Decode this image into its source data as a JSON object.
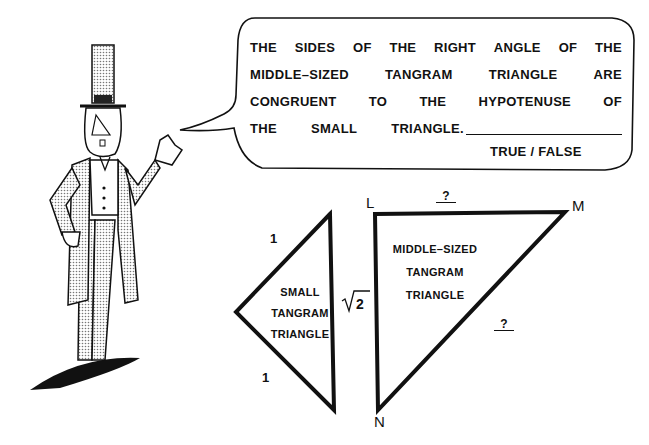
{
  "speech_bubble": {
    "lines": [
      [
        "THE",
        "SIDES",
        "OF",
        "THE",
        "RIGHT",
        "ANGLE",
        "OF",
        "THE"
      ],
      [
        "MIDDLE–SIZED",
        "TANGRAM",
        "TRIANGLE",
        "ARE"
      ],
      [
        "CONGRUENT",
        "TO",
        "THE",
        "HYPOTENUSE",
        "OF"
      ],
      [
        "THE",
        "SMALL",
        "TRIANGLE."
      ]
    ],
    "answer_choice": "TRUE / FALSE"
  },
  "small_triangle": {
    "label_lines": [
      "SMALL",
      "TANGRAM",
      "TRIANGLE"
    ],
    "leg_top": "1",
    "leg_bottom": "1",
    "hypotenuse": "√2"
  },
  "middle_triangle": {
    "label_lines": [
      "MIDDLE–SIZED",
      "TANGRAM",
      "TRIANGLE"
    ],
    "vertices": {
      "top_left": "L",
      "top_right": "M",
      "bottom": "N"
    },
    "side_LM": "?",
    "side_MN": "?"
  },
  "character": {
    "description": "cartoon man in top hat and frock coat waving"
  }
}
